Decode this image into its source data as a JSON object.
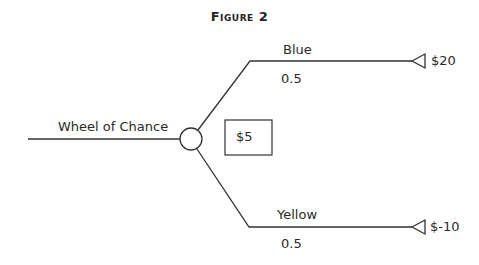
{
  "figure": {
    "title": "Figure 2"
  },
  "decision_tree": {
    "root": {
      "label": "Wheel of Chance",
      "node_type": "chance",
      "expected_value_label": "$5"
    },
    "branches": [
      {
        "label": "Blue",
        "probability": "0.5",
        "payoff": "$20"
      },
      {
        "label": "Yellow",
        "probability": "0.5",
        "payoff": "$-10"
      }
    ]
  },
  "colors": {
    "line": "#333333",
    "background": "#ffffff"
  }
}
